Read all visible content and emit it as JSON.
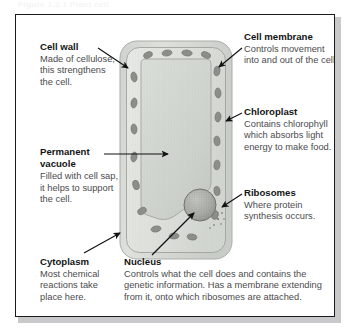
{
  "figure": {
    "caption_partial": "Figure 1.2.1    Plant cell",
    "frame_color": "#1a1a1a",
    "background_color": "#ffffff",
    "text_color": "#4b4b4d",
    "heading_color": "#141414"
  },
  "diagram": {
    "cell_wall_color": "#d8dcd6",
    "cytoplasm_color": "#e3e6e1",
    "vacuole_color": "#d0d5d2",
    "organelle_color": "#8e918c",
    "nucleus_color": "#a7aaa4",
    "chloroplast_count": 18
  },
  "labels": [
    {
      "id": "cell-wall",
      "heading": "Cell wall",
      "body": "Made of cellulose, this strengthens the cell."
    },
    {
      "id": "cell-membrane",
      "heading": "Cell membrane",
      "body": "Controls movement into and out of the cell."
    },
    {
      "id": "chloroplast",
      "heading": "Chloroplast",
      "body": "Contains chlorophyll which absorbs light energy to make food."
    },
    {
      "id": "permanent-vacuole",
      "heading": "Permanent vacuole",
      "body": "Filled with cell sap, it helps to support the cell."
    },
    {
      "id": "ribosomes",
      "heading": "Ribosomes",
      "body": "Where protein synthesis occurs."
    },
    {
      "id": "cytoplasm",
      "heading": "Cytoplasm",
      "body": "Most chemical reactions take place here."
    },
    {
      "id": "nucleus",
      "heading": "Nucleus",
      "body": "Controls what the cell does and contains the genetic information. Has a membrane extending from it, onto which ribosomes are attached."
    }
  ]
}
